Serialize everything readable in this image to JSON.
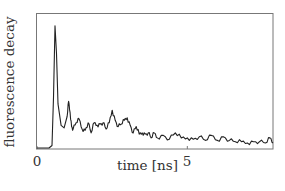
{
  "chart_data": {
    "type": "line",
    "title": "",
    "xlabel": "time [ns]",
    "ylabel": "fluorescence decay",
    "xlim": [
      0,
      7.85
    ],
    "ylim": [
      0,
      1
    ],
    "xticks": [
      {
        "value": 0,
        "label": "0"
      },
      {
        "value": 5,
        "label": "5"
      }
    ],
    "grid": false,
    "legend": null,
    "series": [
      {
        "name": "fluorescence decay",
        "color": "#222222",
        "x": [
          0,
          0.4,
          0.5,
          0.55,
          0.6,
          0.65,
          0.7,
          0.8,
          0.9,
          1.0,
          1.05,
          1.1,
          1.15,
          1.2,
          1.3,
          1.4,
          1.5,
          1.6,
          1.7,
          1.8,
          1.9,
          2.0,
          2.1,
          2.2,
          2.3,
          2.4,
          2.5,
          2.6,
          2.7,
          2.8,
          2.9,
          3.0,
          3.1,
          3.2,
          3.3,
          3.4,
          3.5,
          3.6,
          3.7,
          3.8,
          3.9,
          4.0,
          4.2,
          4.4,
          4.6,
          4.8,
          5.0,
          5.2,
          5.4,
          5.6,
          5.8,
          6.0,
          6.2,
          6.4,
          6.6,
          6.8,
          7.0,
          7.2,
          7.4,
          7.6,
          7.75,
          7.85
        ],
        "y": [
          0.0,
          0.0,
          0.02,
          0.4,
          0.97,
          0.75,
          0.35,
          0.18,
          0.16,
          0.25,
          0.37,
          0.28,
          0.17,
          0.15,
          0.2,
          0.23,
          0.15,
          0.14,
          0.2,
          0.12,
          0.2,
          0.18,
          0.19,
          0.2,
          0.15,
          0.2,
          0.3,
          0.22,
          0.17,
          0.19,
          0.22,
          0.24,
          0.18,
          0.12,
          0.17,
          0.11,
          0.12,
          0.11,
          0.12,
          0.08,
          0.12,
          0.08,
          0.1,
          0.07,
          0.12,
          0.08,
          0.08,
          0.07,
          0.09,
          0.06,
          0.1,
          0.06,
          0.09,
          0.06,
          0.05,
          0.05,
          0.04,
          0.05,
          0.05,
          0.04,
          0.08,
          0.04
        ]
      }
    ]
  }
}
